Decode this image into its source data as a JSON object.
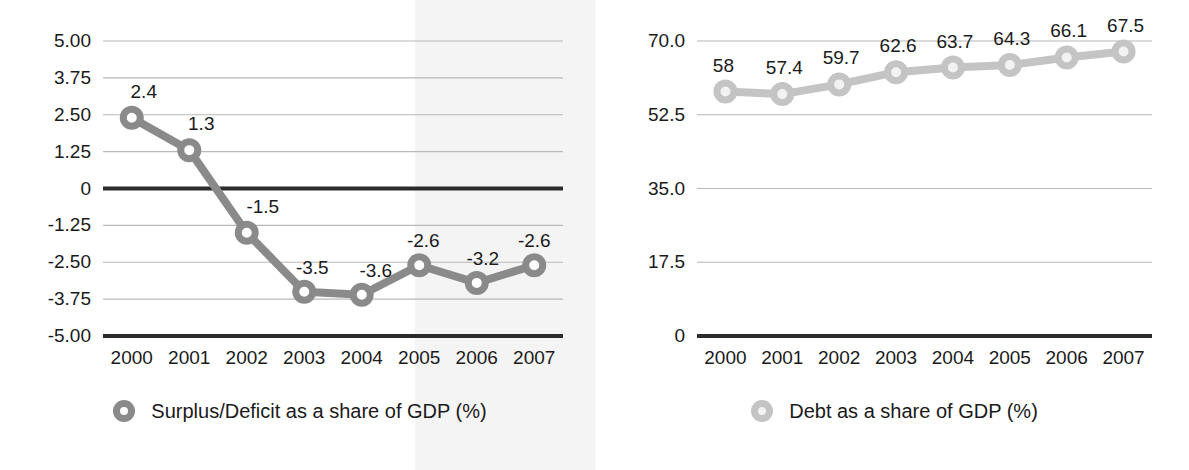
{
  "chart_data": [
    {
      "type": "line",
      "id": "surplus-deficit",
      "title": "",
      "xlabel": "",
      "ylabel": "",
      "categories": [
        "2000",
        "2001",
        "2002",
        "2003",
        "2004",
        "2005",
        "2006",
        "2007"
      ],
      "values": [
        2.4,
        1.3,
        -1.5,
        -3.5,
        -3.6,
        -2.6,
        -3.2,
        -2.6
      ],
      "point_labels": [
        "2.4",
        "1.3",
        "-1.5",
        "-3.5",
        "-3.6",
        "-2.6",
        "-3.2",
        "-2.6"
      ],
      "ylim": [
        -5.0,
        5.0
      ],
      "yticks": [
        5.0,
        3.75,
        2.5,
        1.25,
        0,
        -1.25,
        -2.5,
        -3.75,
        -5.0
      ],
      "ytick_labels": [
        "5.00",
        "3.75",
        "2.50",
        "1.25",
        "0",
        "-1.25",
        "-2.50",
        "-3.75",
        "-5.00"
      ],
      "grid": true,
      "legend_position": "bottom",
      "legend": [
        "Surplus/Deficit as a share of GDP (%)"
      ],
      "series_color": "#8a8a8a",
      "marker_fill": "#ffffff",
      "emphasis_lines": [
        "0",
        "-5.00"
      ]
    },
    {
      "type": "line",
      "id": "debt",
      "title": "",
      "xlabel": "",
      "ylabel": "",
      "categories": [
        "2000",
        "2001",
        "2002",
        "2003",
        "2004",
        "2005",
        "2006",
        "2007"
      ],
      "values": [
        58,
        57.4,
        59.7,
        62.6,
        63.7,
        64.3,
        66.1,
        67.5
      ],
      "point_labels": [
        "58",
        "57.4",
        "59.7",
        "62.6",
        "63.7",
        "64.3",
        "66.1",
        "67.5"
      ],
      "ylim": [
        0,
        70.0
      ],
      "yticks": [
        70.0,
        52.5,
        35.0,
        17.5,
        0
      ],
      "ytick_labels": [
        "70.0",
        "52.5",
        "35.0",
        "17.5",
        "0"
      ],
      "grid": true,
      "legend_position": "bottom",
      "legend": [
        "Debt as a share of GDP (%)"
      ],
      "series_color": "#c4c4c4",
      "marker_fill": "#f2f2f2",
      "emphasis_lines": [
        "0"
      ]
    }
  ],
  "colors": {
    "background": "#ffffff",
    "text": "#1a1a1a",
    "gridline": "#b8b8b8",
    "axis_emphasis": "#2b2b2b",
    "series_deficit": "#8a8a8a",
    "series_debt": "#c4c4c4"
  }
}
